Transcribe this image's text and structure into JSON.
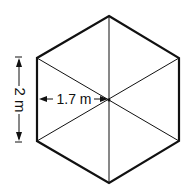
{
  "diagram": {
    "shape": "regular hexagon divided into 6 triangles",
    "side_label": "2 m",
    "apothem_label": "1.7 m",
    "colors": {
      "stroke": "#111111",
      "background": "#ffffff"
    }
  }
}
